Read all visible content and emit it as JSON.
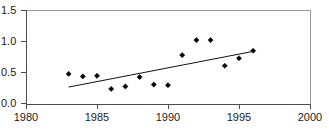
{
  "chart_data": {
    "type": "scatter",
    "title": "",
    "subtitle": "",
    "xlabel": "",
    "ylabel": "",
    "xlim": [
      1980,
      2000
    ],
    "ylim": [
      0.0,
      1.5
    ],
    "grid": false,
    "legend": null,
    "x_ticks": [
      1980,
      1985,
      1990,
      1995,
      2000
    ],
    "x_tick_labels": [
      "1980",
      "1985",
      "1990",
      "1995",
      "2000"
    ],
    "y_ticks": [
      0.0,
      0.5,
      1.0,
      1.5
    ],
    "y_tick_labels": [
      "0.0",
      "0.5",
      "1.0",
      "1.5"
    ],
    "series": [
      {
        "name": "observations",
        "marker": "filled-diamond",
        "color": "#000000",
        "x": [
          1983,
          1984,
          1985,
          1986,
          1987,
          1988,
          1989,
          1990,
          1991,
          1992,
          1993,
          1994,
          1995,
          1996
        ],
        "y": [
          0.48,
          0.44,
          0.45,
          0.24,
          0.28,
          0.43,
          0.31,
          0.3,
          0.78,
          1.02,
          1.02,
          0.61,
          0.73,
          0.85
        ]
      },
      {
        "name": "trend-line",
        "type": "line",
        "color": "#111111",
        "x": [
          1983,
          1996
        ],
        "y": [
          0.27,
          0.84
        ]
      }
    ]
  },
  "axes": {
    "y_axis_name": "value-axis",
    "x_axis_name": "year-axis"
  }
}
